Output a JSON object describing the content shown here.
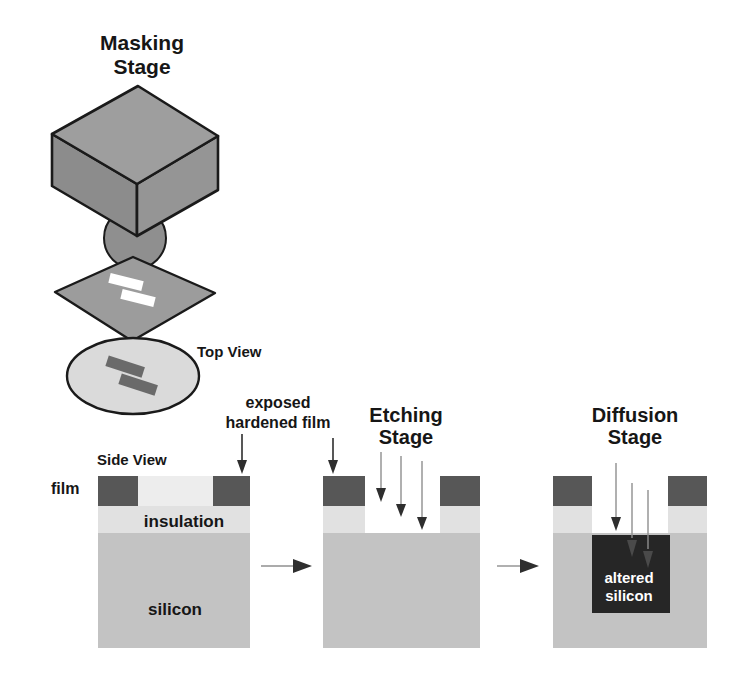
{
  "colors": {
    "page_bg": "#ffffff",
    "text": "#161616",
    "altered_text": "#ffffff",
    "outline": "#1a1a1a",
    "cube_top": "#9e9e9e",
    "cube_left": "#8c8c8c",
    "cube_right": "#959595",
    "lens": "#8f8f8f",
    "mask_plate": "#9c9c9c",
    "mask_aperture": "#ffffff",
    "wafer": "#dadada",
    "wafer_pattern": "#6a6a6a",
    "film_hardened": "#575757",
    "film_soft": "#ededed",
    "insulation": "#e1e1e1",
    "silicon": "#c3c3c3",
    "altered_silicon": "#262626",
    "arrow_line": "#8f8f8f",
    "arrow_dark": "#2e2e2e",
    "arrow_faint": "#4a4a4a"
  },
  "diagram": {
    "masking": {
      "title": [
        "Masking",
        "Stage"
      ],
      "top_view_label": "Top View"
    },
    "side_view": {
      "label": "Side View",
      "film_label": "film",
      "insulation_label": "insulation",
      "silicon_label": "silicon",
      "exposed_film_label": [
        "exposed",
        "hardened film"
      ]
    },
    "etching": {
      "title": [
        "Etching",
        "Stage"
      ]
    },
    "diffusion": {
      "title": [
        "Diffusion",
        "Stage"
      ],
      "altered_silicon_label": [
        "altered",
        "silicon"
      ]
    }
  }
}
